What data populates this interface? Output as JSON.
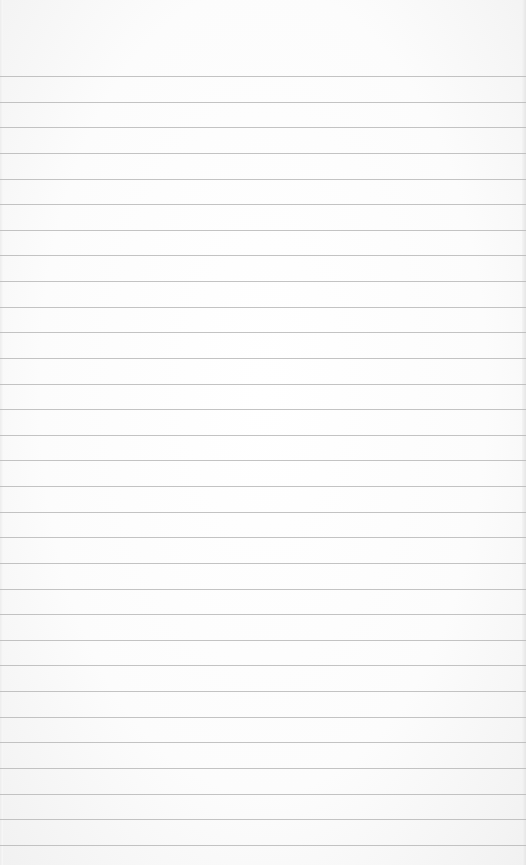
{
  "page": {
    "line_count": 31,
    "first_line_y": 76,
    "line_spacing": 25.63,
    "colors": {
      "paper": "#fdfdfd",
      "rule": "#b9b9b9"
    }
  }
}
